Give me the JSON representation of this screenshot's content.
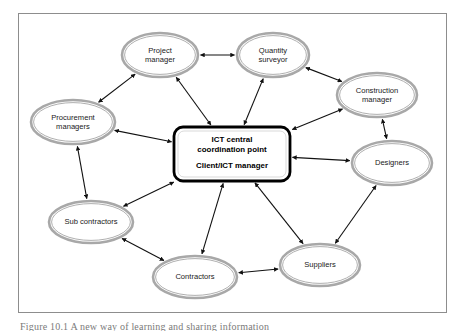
{
  "figure": {
    "caption": "Figure 10.1  A new way of learning and sharing information",
    "frame_border_color": "#8d8d8d",
    "background_color": "#ffffff"
  },
  "diagram": {
    "type": "network-diagram",
    "center": {
      "id": "ict-central-coordination-point",
      "line1": "ICT central",
      "line2": "coordination point",
      "line3": "Client/ICT manager",
      "shape": "rounded-rectangle",
      "border_color": "#000000",
      "fill_color": "#ffffff",
      "cx": 232,
      "cy": 154,
      "width": 116,
      "height": 54
    },
    "node_style": {
      "shape": "ellipse",
      "outer_ring_color": "#a8a8a8",
      "inner_ring_color": "#9a9a9a",
      "fill_color": "#ffffff",
      "text_color": "#1a1a1a"
    },
    "nodes": [
      {
        "id": "project-manager",
        "line1": "Project",
        "line2": "manager",
        "cx": 160,
        "cy": 55,
        "rx": 38,
        "ry": 22
      },
      {
        "id": "quantity-surveyor",
        "line1": "Quantity",
        "line2": "surveyor",
        "cx": 273,
        "cy": 55,
        "rx": 36,
        "ry": 22
      },
      {
        "id": "construction-manager",
        "line1": "Construction",
        "line2": "manager",
        "cx": 377,
        "cy": 95,
        "rx": 40,
        "ry": 22
      },
      {
        "id": "designers",
        "line1": "Designers",
        "line2": "",
        "cx": 392,
        "cy": 163,
        "rx": 40,
        "ry": 22
      },
      {
        "id": "suppliers",
        "line1": "Suppliers",
        "line2": "",
        "cx": 320,
        "cy": 265,
        "rx": 40,
        "ry": 21
      },
      {
        "id": "contractors",
        "line1": "Contractors",
        "line2": "",
        "cx": 195,
        "cy": 277,
        "rx": 42,
        "ry": 21
      },
      {
        "id": "sub-contractors",
        "line1": "Sub contractors",
        "line2": "",
        "cx": 91,
        "cy": 222,
        "rx": 42,
        "ry": 21
      },
      {
        "id": "procurement-managers",
        "line1": "Procurement",
        "line2": "managers",
        "cx": 73,
        "cy": 122,
        "rx": 42,
        "ry": 22
      }
    ],
    "edges": [
      {
        "from": "project-manager",
        "to": "quantity-surveyor",
        "arrow": "double"
      },
      {
        "from": "project-manager",
        "to": "procurement-managers",
        "arrow": "double"
      },
      {
        "from": "project-manager",
        "to": "ict-central-coordination-point",
        "arrow": "double"
      },
      {
        "from": "quantity-surveyor",
        "to": "ict-central-coordination-point",
        "arrow": "double"
      },
      {
        "from": "quantity-surveyor",
        "to": "construction-manager",
        "arrow": "double"
      },
      {
        "from": "construction-manager",
        "to": "ict-central-coordination-point",
        "arrow": "double"
      },
      {
        "from": "construction-manager",
        "to": "designers",
        "arrow": "double"
      },
      {
        "from": "designers",
        "to": "ict-central-coordination-point",
        "arrow": "double"
      },
      {
        "from": "designers",
        "to": "suppliers",
        "arrow": "double"
      },
      {
        "from": "suppliers",
        "to": "ict-central-coordination-point",
        "arrow": "double"
      },
      {
        "from": "suppliers",
        "to": "contractors",
        "arrow": "double"
      },
      {
        "from": "contractors",
        "to": "ict-central-coordination-point",
        "arrow": "double"
      },
      {
        "from": "contractors",
        "to": "sub-contractors",
        "arrow": "double"
      },
      {
        "from": "sub-contractors",
        "to": "ict-central-coordination-point",
        "arrow": "double"
      },
      {
        "from": "sub-contractors",
        "to": "procurement-managers",
        "arrow": "double"
      },
      {
        "from": "procurement-managers",
        "to": "ict-central-coordination-point",
        "arrow": "double"
      }
    ]
  }
}
